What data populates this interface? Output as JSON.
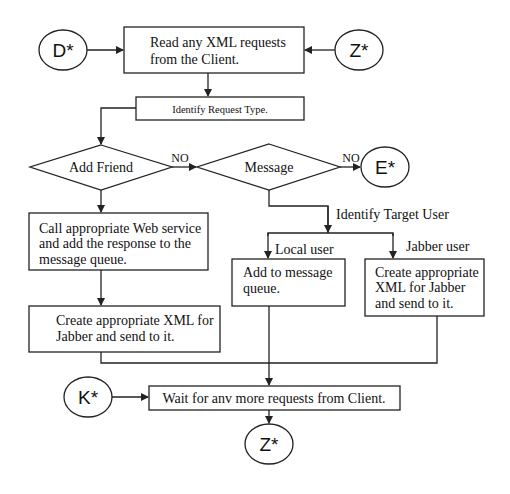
{
  "diagram": {
    "type": "flowchart",
    "connectors": {
      "d": "D*",
      "z_top": "Z*",
      "e": "E*",
      "k": "K*",
      "z_bottom": "Z*"
    },
    "process": {
      "read_requests": [
        "Read any XML requests",
        "from the Client."
      ],
      "identify_request_type": "Identify Request Type.",
      "call_web_service": [
        "Call appropriate Web service",
        "and add the response to the",
        "message queue."
      ],
      "create_xml_left": [
        "Create appropriate XML for",
        "Jabber and send to it."
      ],
      "add_to_queue": [
        "Add to message",
        "queue."
      ],
      "create_xml_right": [
        "Create appropriate",
        "XML for Jabber",
        "and send to it."
      ],
      "wait_requests": "Wait for anv more requests from Client."
    },
    "decisions": {
      "add_friend": "Add Friend",
      "message": "Message"
    },
    "edge_labels": {
      "no_1": "NO",
      "no_2": "NO",
      "identify_target_user": "Identify Target User",
      "local_user": "Local user",
      "jabber_user": "Jabber user"
    }
  }
}
